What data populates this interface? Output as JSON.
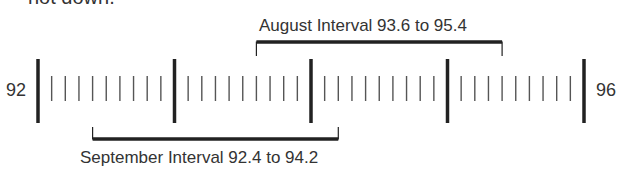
{
  "header": {
    "cut_text": "not down."
  },
  "number_line": {
    "start": 92,
    "end": 96,
    "start_label": "92",
    "end_label": "96",
    "major_every": 1,
    "minor_step": 0.1
  },
  "intervals": [
    {
      "name": "August",
      "label": "August Interval 93.6 to 95.4",
      "low": 93.6,
      "high": 95.4,
      "position": "above"
    },
    {
      "name": "September",
      "label": "September Interval 92.4 to 94.2",
      "low": 92.4,
      "high": 94.2,
      "position": "below"
    }
  ],
  "colors": {
    "line": "#222222",
    "text": "#333333"
  }
}
